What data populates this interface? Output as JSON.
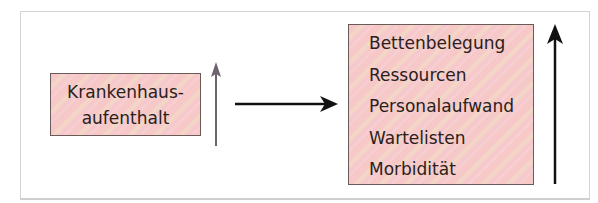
{
  "diagram": {
    "left_box": {
      "lines": [
        "Krankenhaus-",
        "aufenthalt"
      ]
    },
    "right_box": {
      "items": [
        "Bettenbelegung",
        "Ressourcen",
        "Personalaufwand",
        "Wartelisten",
        "Morbidität"
      ]
    },
    "arrows": {
      "left_up": {
        "direction": "up",
        "color": "#6e6470"
      },
      "middle_right": {
        "direction": "right",
        "color": "#111111"
      },
      "right_up": {
        "direction": "up",
        "color": "#111111"
      }
    },
    "colors": {
      "box_fill": "#f6c8c8",
      "box_border": "#6a5a5a",
      "frame_border": "#d4d4d4"
    }
  }
}
